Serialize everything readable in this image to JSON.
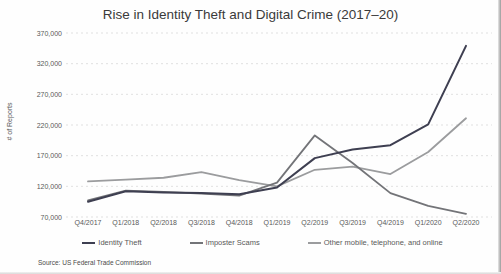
{
  "chart_data": {
    "type": "line",
    "title": "Rise in Identity Theft and Digital Crime (2017–20)",
    "ylabel": "# of Reports",
    "xlabel": "",
    "ylim": [
      70000,
      370000
    ],
    "ytick_step": 50000,
    "ytick_labels": [
      "70,000",
      "120,000",
      "170,000",
      "220,000",
      "270,000",
      "320,000",
      "370,000"
    ],
    "categories": [
      "Q4/2017",
      "Q1/2018",
      "Q2/2018",
      "Q3/2018",
      "Q4/2018",
      "Q1/2019",
      "Q2/2019",
      "Q3/2019",
      "Q4/2019",
      "Q1/2020",
      "Q2/2020"
    ],
    "series": [
      {
        "name": "Identity Theft",
        "color": "#3e3f51",
        "values": [
          95000,
          112000,
          110000,
          109000,
          107000,
          118000,
          166000,
          180000,
          187000,
          221000,
          349000
        ]
      },
      {
        "name": "Imposter Scams",
        "color": "#737478",
        "values": [
          97000,
          113000,
          111000,
          108000,
          105000,
          126000,
          203000,
          158000,
          109000,
          88000,
          75000
        ]
      },
      {
        "name": "Other mobile, telephone, and online",
        "color": "#9b9c9e",
        "values": [
          128000,
          131000,
          134000,
          143000,
          130000,
          120000,
          147000,
          152000,
          140000,
          176000,
          231000
        ]
      }
    ],
    "grid": "horizontal-dashed",
    "grid_color": "#d9d9d9",
    "legend_position": "bottom"
  },
  "source_note": "Source: US Federal Trade Commission"
}
